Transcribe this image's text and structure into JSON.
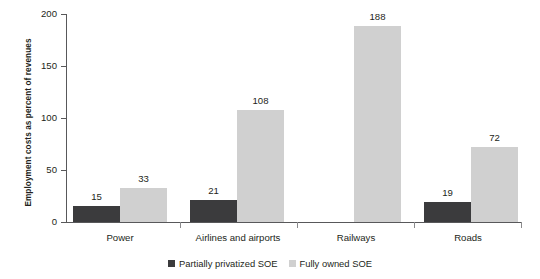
{
  "chart_data": {
    "type": "bar",
    "title": "",
    "xlabel": "",
    "ylabel": "Employment costs as percent of revenues",
    "ylim": [
      0,
      200
    ],
    "yticks": [
      0,
      50,
      100,
      150,
      200
    ],
    "grid": false,
    "legend_position": "bottom-center",
    "categories": [
      "Power",
      "Airlines and airports",
      "Railways",
      "Roads"
    ],
    "series": [
      {
        "name": "Partially privatized SOE",
        "color": "#3b3b3d",
        "values": [
          15,
          21,
          null,
          19
        ]
      },
      {
        "name": "Fully owned SOE",
        "color": "#d0d0d0",
        "values": [
          33,
          108,
          188,
          72
        ]
      }
    ]
  },
  "axis": {
    "line_color": "#58585a"
  }
}
